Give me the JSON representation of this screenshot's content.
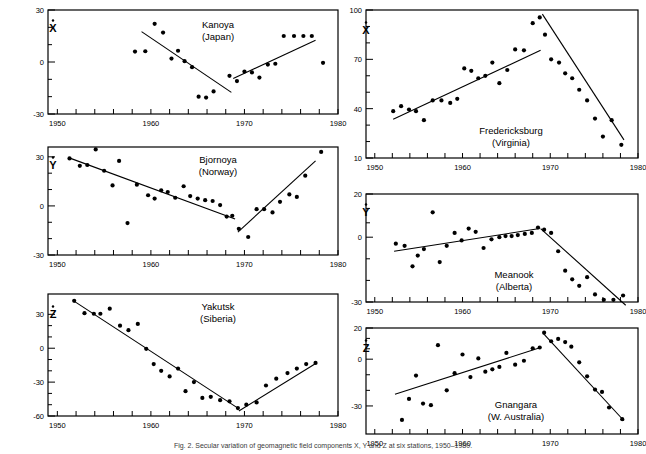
{
  "figure": {
    "caption": "Fig. 2. Secular variation of geomagnetic field components X, Y and Z at six stations, 1950–1980.",
    "axis_x_label_years": [
      "1950",
      "1960",
      "1970",
      "1980"
    ]
  },
  "chart_data": [
    {
      "id": "kanoya",
      "type": "scatter",
      "title": "Kanoya",
      "subtitle": "(Japan)",
      "component": "X",
      "component_label": "Ẋ",
      "xlabel": "",
      "ylabel": "",
      "xlim": [
        1949,
        1980
      ],
      "ylim": [
        -30,
        30
      ],
      "yticks": [
        -30,
        0,
        30
      ],
      "ytick_labels": [
        "-30",
        "0",
        "30"
      ],
      "xticks": [
        1950,
        1952,
        1954,
        1956,
        1958,
        1960,
        1962,
        1964,
        1966,
        1968,
        1970,
        1972,
        1974,
        1976,
        1978,
        1980
      ],
      "xtick_labels_shown": [
        "1950",
        "1960",
        "1970",
        "1980"
      ],
      "grid": false,
      "x": [
        1958.3,
        1959.4,
        1960.4,
        1961.3,
        1962.2,
        1962.9,
        1963.6,
        1964.4,
        1965.1,
        1965.9,
        1966.7,
        1968.4,
        1969.2,
        1970.0,
        1970.8,
        1971.6,
        1972.5,
        1973.3,
        1974.2,
        1975.3,
        1976.3,
        1977.2,
        1978.4
      ],
      "y": [
        6.0,
        6.2,
        22.0,
        17.0,
        2.0,
        6.5,
        0.5,
        -3.0,
        -20.0,
        -20.5,
        -17.0,
        -8.0,
        -11.0,
        -5.5,
        -6.0,
        -9.0,
        -1.5,
        -1.0,
        15.0,
        15.0,
        15.0,
        15.0,
        -0.5
      ],
      "fit_segments": [
        {
          "name": "declining-trend",
          "x": [
            1959.0,
            1968.6
          ],
          "y": [
            17.5,
            -17.5
          ]
        },
        {
          "name": "rising-trend",
          "x": [
            1968.8,
            1977.6
          ],
          "y": [
            -9.5,
            12.5
          ]
        }
      ]
    },
    {
      "id": "bjornoya",
      "type": "scatter",
      "title": "Bjornoya",
      "subtitle": "(Norway)",
      "component": "Y",
      "component_label": "Ẏ",
      "xlabel": "",
      "ylabel": "",
      "xlim": [
        1949,
        1980
      ],
      "ylim": [
        -30,
        36
      ],
      "yticks": [
        -30,
        0,
        30
      ],
      "ytick_labels": [
        "-30",
        "0",
        "30"
      ],
      "xticks": [
        1950,
        1952,
        1954,
        1956,
        1958,
        1960,
        1962,
        1964,
        1966,
        1968,
        1970,
        1972,
        1974,
        1976,
        1978,
        1980
      ],
      "xtick_labels_shown": [
        "1950",
        "1960",
        "1970",
        "1980"
      ],
      "grid": false,
      "x": [
        1951.3,
        1952.4,
        1953.2,
        1954.1,
        1955.0,
        1955.9,
        1956.6,
        1957.5,
        1958.5,
        1959.7,
        1960.4,
        1961.1,
        1961.8,
        1962.6,
        1963.5,
        1964.2,
        1965.0,
        1965.8,
        1966.6,
        1967.4,
        1968.1,
        1968.7,
        1969.4,
        1970.4,
        1971.3,
        1972.1,
        1973.0,
        1973.8,
        1974.8,
        1975.6,
        1976.5,
        1978.2
      ],
      "y": [
        29.0,
        24.5,
        25.0,
        34.5,
        21.5,
        12.5,
        27.5,
        -10.5,
        13.0,
        6.5,
        4.5,
        9.5,
        8.5,
        5.0,
        12.0,
        6.0,
        4.5,
        3.5,
        3.0,
        0.5,
        -6.5,
        -6.0,
        -14.0,
        -19.0,
        -2.0,
        -2.0,
        -4.0,
        2.5,
        7.0,
        5.5,
        18.5,
        33.0
      ],
      "fit_segments": [
        {
          "name": "declining-trend",
          "x": [
            1951.2,
            1969.0
          ],
          "y": [
            29.5,
            -8.0
          ]
        },
        {
          "name": "rising-trend",
          "x": [
            1969.3,
            1977.6
          ],
          "y": [
            -16.0,
            27.5
          ]
        }
      ]
    },
    {
      "id": "yakutsk",
      "type": "scatter",
      "title": "Yakutsk",
      "subtitle": "(Siberia)",
      "component": "Z",
      "component_label": "Ż",
      "xlabel": "",
      "ylabel": "",
      "xlim": [
        1949,
        1980
      ],
      "ylim": [
        -60,
        48
      ],
      "yticks": [
        -60,
        -30,
        0,
        30
      ],
      "ytick_labels": [
        "-60",
        "-30",
        "0",
        "30"
      ],
      "xticks": [
        1950,
        1952,
        1954,
        1956,
        1958,
        1960,
        1962,
        1964,
        1966,
        1968,
        1970,
        1972,
        1974,
        1976,
        1978,
        1980
      ],
      "xtick_labels_shown": [
        "1950",
        "1960",
        "1970",
        "1980"
      ],
      "grid": false,
      "x": [
        1951.8,
        1952.9,
        1953.9,
        1954.6,
        1955.6,
        1956.7,
        1957.6,
        1958.6,
        1959.5,
        1960.3,
        1961.1,
        1962.0,
        1962.9,
        1963.7,
        1964.6,
        1965.5,
        1966.4,
        1967.4,
        1968.4,
        1969.3,
        1970.2,
        1971.3,
        1972.3,
        1973.4,
        1974.6,
        1975.6,
        1976.6,
        1977.6
      ],
      "y": [
        42.0,
        31.0,
        30.5,
        30.5,
        35.0,
        20.0,
        16.0,
        21.5,
        -0.5,
        -14.0,
        -20.0,
        -25.0,
        -18.0,
        -38.0,
        -30.0,
        -44.0,
        -43.0,
        -46.0,
        -47.0,
        -53.0,
        -50.0,
        -48.0,
        -33.0,
        -27.0,
        -22.0,
        -18.0,
        -14.0,
        -13.0
      ],
      "fit_segments": [
        {
          "name": "declining-trend",
          "x": [
            1951.9,
            1969.3
          ],
          "y": [
            41.0,
            -53.0
          ]
        },
        {
          "name": "rising-trend",
          "x": [
            1969.4,
            1977.7
          ],
          "y": [
            -55.5,
            -13.0
          ]
        }
      ]
    },
    {
      "id": "fredericksburg",
      "type": "scatter",
      "title": "Fredericksburg",
      "subtitle": "(Virginia)",
      "component": "X",
      "component_label": "Ẋ",
      "xlabel": "",
      "ylabel": "",
      "xlim": [
        1949,
        1980
      ],
      "ylim": [
        10,
        100
      ],
      "yticks": [
        10,
        40,
        70,
        100
      ],
      "ytick_labels": [
        "10",
        "40",
        "70",
        "100"
      ],
      "xticks": [
        1950,
        1952,
        1954,
        1956,
        1958,
        1960,
        1962,
        1964,
        1966,
        1968,
        1970,
        1972,
        1974,
        1976,
        1978,
        1980
      ],
      "xtick_labels_shown": [
        "1950",
        "1960",
        "1970",
        "1980"
      ],
      "grid": false,
      "x": [
        1952.1,
        1953.0,
        1953.9,
        1954.7,
        1955.6,
        1956.6,
        1957.6,
        1958.6,
        1959.4,
        1960.2,
        1961.0,
        1961.8,
        1962.6,
        1963.4,
        1964.2,
        1965.1,
        1966.0,
        1967.0,
        1968.0,
        1968.8,
        1969.4,
        1970.1,
        1971.0,
        1971.7,
        1972.5,
        1973.3,
        1974.2,
        1975.1,
        1976.0,
        1977.0,
        1978.1
      ],
      "y": [
        38.5,
        41.5,
        39.5,
        38.5,
        33.0,
        45.0,
        45.0,
        43.5,
        46.0,
        64.5,
        63.0,
        58.5,
        60.0,
        68.0,
        55.5,
        63.5,
        76.0,
        75.5,
        92.0,
        95.5,
        85.0,
        70.0,
        68.0,
        61.5,
        58.5,
        51.5,
        45.0,
        34.0,
        23.0,
        33.0,
        18.0
      ],
      "fit_segments": [
        {
          "name": "rising-trend",
          "x": [
            1952.1,
            1968.9
          ],
          "y": [
            33.5,
            75.5
          ]
        },
        {
          "name": "declining-trend",
          "x": [
            1969.1,
            1978.4
          ],
          "y": [
            97.5,
            21.0
          ]
        }
      ]
    },
    {
      "id": "meanook",
      "type": "scatter",
      "title": "Meanook",
      "subtitle": "(Alberta)",
      "component": "Y",
      "component_label": "Ẏ",
      "xlabel": "",
      "ylabel": "",
      "xlim": [
        1949,
        1980
      ],
      "ylim": [
        -30,
        20
      ],
      "yticks": [
        -30,
        0,
        20
      ],
      "ytick_labels": [
        "-30",
        "0",
        "20"
      ],
      "xticks": [
        1950,
        1952,
        1954,
        1956,
        1958,
        1960,
        1962,
        1964,
        1966,
        1968,
        1970,
        1972,
        1974,
        1976,
        1978,
        1980
      ],
      "xtick_labels_shown": [
        "1950",
        "1960",
        "1970",
        "1980"
      ],
      "grid": false,
      "x": [
        1952.4,
        1953.4,
        1954.3,
        1954.9,
        1955.6,
        1956.6,
        1957.4,
        1958.2,
        1959.1,
        1959.9,
        1960.7,
        1961.5,
        1962.4,
        1963.3,
        1964.2,
        1964.9,
        1965.6,
        1966.3,
        1967.1,
        1967.9,
        1968.6,
        1969.3,
        1970.1,
        1970.9,
        1971.7,
        1972.5,
        1973.3,
        1974.2,
        1975.1,
        1976.1,
        1977.2,
        1978.3
      ],
      "y": [
        -3.0,
        -4.0,
        -13.5,
        -8.5,
        -5.5,
        11.5,
        -11.5,
        -4.0,
        2.0,
        -1.5,
        4.0,
        2.5,
        -5.0,
        -1.0,
        0.0,
        0.5,
        0.5,
        1.0,
        1.5,
        2.0,
        4.5,
        3.5,
        2.0,
        -6.5,
        -15.5,
        -19.5,
        -22.5,
        -18.5,
        -26.5,
        -29.0,
        -29.0,
        -27.0
      ],
      "fit_segments": [
        {
          "name": "rising-trend",
          "x": [
            1952.2,
            1968.8
          ],
          "y": [
            -6.5,
            4.0
          ]
        },
        {
          "name": "declining-trend",
          "x": [
            1968.9,
            1978.6
          ],
          "y": [
            4.0,
            -31.5
          ]
        }
      ]
    },
    {
      "id": "gnangara",
      "type": "scatter",
      "title": "Gnangara",
      "subtitle": "(W. Australia)",
      "component": "Z",
      "component_label": "Ż",
      "xlabel": "",
      "ylabel": "",
      "xlim": [
        1949,
        1980
      ],
      "ylim": [
        -48,
        20
      ],
      "yticks": [
        -30,
        0,
        20
      ],
      "ytick_labels": [
        "-30",
        "0",
        "20"
      ],
      "xticks": [
        1950,
        1952,
        1954,
        1956,
        1958,
        1960,
        1962,
        1964,
        1966,
        1968,
        1970,
        1972,
        1974,
        1976,
        1978,
        1980
      ],
      "xtick_labels_shown": [
        "1950",
        "1960",
        "1970",
        "1980"
      ],
      "grid": false,
      "x": [
        1953.1,
        1953.9,
        1954.7,
        1955.5,
        1956.4,
        1957.2,
        1958.2,
        1959.1,
        1960.0,
        1960.9,
        1961.8,
        1962.6,
        1963.4,
        1964.2,
        1965.0,
        1966.0,
        1967.0,
        1968.0,
        1968.8,
        1969.3,
        1970.1,
        1970.9,
        1971.7,
        1972.4,
        1973.3,
        1974.2,
        1975.1,
        1975.9,
        1976.7,
        1978.2
      ],
      "y": [
        -39.0,
        -25.5,
        -10.5,
        -28.5,
        -29.5,
        9.0,
        -20.0,
        -9.0,
        3.0,
        -11.5,
        0.5,
        -8.0,
        -6.5,
        -5.0,
        4.0,
        -3.5,
        -1.0,
        7.0,
        7.5,
        17.0,
        11.5,
        13.0,
        11.0,
        8.0,
        -2.0,
        -11.0,
        -19.5,
        -21.0,
        -31.0,
        -38.5
      ],
      "fit_segments": [
        {
          "name": "rising-trend",
          "x": [
            1952.3,
            1968.9
          ],
          "y": [
            -22.5,
            7.5
          ]
        },
        {
          "name": "declining-trend",
          "x": [
            1969.2,
            1978.4
          ],
          "y": [
            16.5,
            -39.5
          ]
        }
      ]
    }
  ]
}
